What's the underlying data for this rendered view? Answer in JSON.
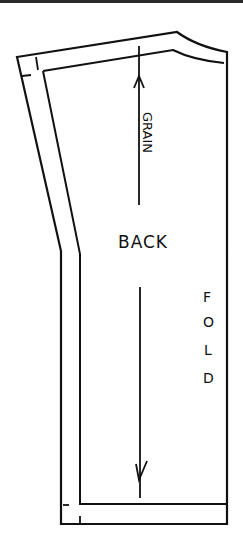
{
  "pattern": {
    "piece_label": "BACK",
    "grain_label": "GRAIN",
    "fold_label": "FOLD",
    "fold_letters": [
      "F",
      "O",
      "L",
      "D"
    ]
  },
  "colors": {
    "line": "#111111",
    "background": "#ffffff",
    "top_bar": "#2a2a2a"
  }
}
